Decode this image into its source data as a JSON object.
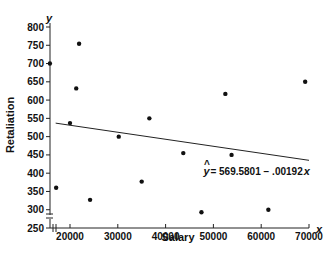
{
  "chart_data": {
    "type": "scatter",
    "title": "",
    "xlabel": "Salary",
    "ylabel": "Retaliation",
    "x_var": "x",
    "y_var": "y",
    "xlim": [
      15000,
      70000
    ],
    "ylim": [
      250,
      800
    ],
    "x_ticks": [
      20000,
      30000,
      40000,
      50000,
      60000,
      70000
    ],
    "x_tick_labels": [
      "20000",
      "30000",
      "40000",
      "50000",
      "60000",
      "70000"
    ],
    "y_ticks": [
      250,
      300,
      350,
      400,
      450,
      500,
      550,
      600,
      650,
      700,
      750,
      800
    ],
    "y_tick_labels": [
      "250",
      "300",
      "350",
      "400",
      "450",
      "500",
      "550",
      "600",
      "650",
      "700",
      "750",
      "800"
    ],
    "axis_breaks": true,
    "grid": false,
    "points": [
      {
        "x": 15800,
        "y": 700
      },
      {
        "x": 21900,
        "y": 754
      },
      {
        "x": 21300,
        "y": 632
      },
      {
        "x": 20000,
        "y": 537
      },
      {
        "x": 30200,
        "y": 500
      },
      {
        "x": 36600,
        "y": 550
      },
      {
        "x": 35000,
        "y": 377
      },
      {
        "x": 17100,
        "y": 360
      },
      {
        "x": 24200,
        "y": 327
      },
      {
        "x": 43700,
        "y": 455
      },
      {
        "x": 52500,
        "y": 617
      },
      {
        "x": 53800,
        "y": 450
      },
      {
        "x": 47500,
        "y": 293
      },
      {
        "x": 61500,
        "y": 300
      },
      {
        "x": 69200,
        "y": 650
      }
    ],
    "regression": {
      "intercept": 569.5801,
      "slope": -0.00192,
      "x_range": [
        17000,
        70000
      ]
    },
    "annotation": {
      "hat_var": "y",
      "text": "= 569.5801 − .00192",
      "trailing_var": "x",
      "x": 50000,
      "y": 395
    }
  }
}
